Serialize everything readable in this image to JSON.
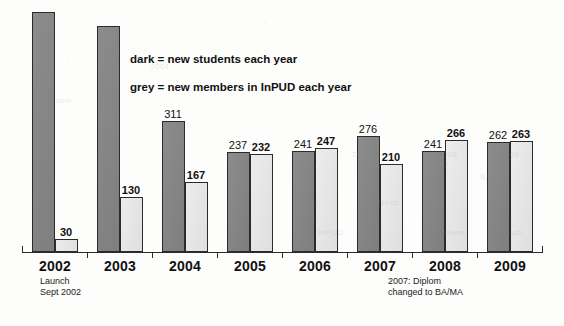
{
  "legend": {
    "line1": "dark = new students each year",
    "line2": "grey = new members in InPUD each year"
  },
  "notes": {
    "launch": "Launch\nSept 2002",
    "diplom": "2007: Diplom\nchanged to BA/MA"
  },
  "colors": {
    "dark_bar": "#858585",
    "grey_bar": "#ebebeb",
    "bar_border": "#2b2b2b",
    "axis": "#2b2b2b",
    "text": "#111111",
    "page_background": "#fdfdfc"
  },
  "axis": {
    "years": [
      "2002",
      "2003",
      "2004",
      "2005",
      "2006",
      "2007",
      "2008",
      "2009"
    ]
  },
  "labels": {
    "dark": [
      "",
      "",
      "311",
      "237",
      "241",
      "276",
      "241",
      "262"
    ],
    "grey": [
      "30",
      "130",
      "167",
      "232",
      "247",
      "210",
      "266",
      "263"
    ]
  },
  "ghost_text": [
    {
      "t": "2006",
      "x": 296,
      "y": 150
    },
    {
      "t": "2007",
      "x": 352,
      "y": 150
    },
    {
      "t": "2008",
      "x": 438,
      "y": 150
    },
    {
      "t": "2009",
      "x": 500,
      "y": 150
    },
    {
      "t": "DIPL",
      "x": 300,
      "y": 162
    },
    {
      "t": "AND",
      "x": 430,
      "y": 160
    },
    {
      "t": "BA/MA",
      "x": 480,
      "y": 172
    },
    {
      "t": "2002",
      "x": 300,
      "y": 200
    },
    {
      "t": "students",
      "x": 364,
      "y": 198
    },
    {
      "t": "2009",
      "x": 488,
      "y": 200
    },
    {
      "t": "InPUD",
      "x": 318,
      "y": 228
    },
    {
      "t": "members",
      "x": 430,
      "y": 228
    },
    {
      "t": "each",
      "x": 504,
      "y": 228
    },
    {
      "t": "new",
      "x": 56,
      "y": 96
    },
    {
      "t": "2004",
      "x": 150,
      "y": 62
    }
  ],
  "chart_data": {
    "type": "bar",
    "title": "",
    "subtitle": "",
    "xlabel": "",
    "ylabel": "",
    "categories": [
      "2002",
      "2003",
      "2004",
      "2005",
      "2006",
      "2007",
      "2008",
      "2009"
    ],
    "series": [
      {
        "name": "dark = new students each year",
        "color": "#858585",
        "values": [
          571,
          537,
          311,
          237,
          241,
          276,
          241,
          262
        ],
        "labels_shown": [
          false,
          false,
          true,
          true,
          true,
          true,
          true,
          true
        ]
      },
      {
        "name": "grey = new members in InPUD each year",
        "color": "#ebebeb",
        "values": [
          30,
          130,
          167,
          232,
          247,
          210,
          266,
          263
        ],
        "labels_shown": [
          true,
          true,
          true,
          true,
          true,
          true,
          true,
          true
        ]
      }
    ],
    "ylim": [
      0,
      580
    ],
    "grid": false,
    "legend_position": "inside-top-left",
    "annotations": [
      {
        "text": "Launch Sept 2002",
        "attached_to": "2002"
      },
      {
        "text": "2007: Diplom changed to BA/MA",
        "attached_to": "2007"
      }
    ]
  }
}
